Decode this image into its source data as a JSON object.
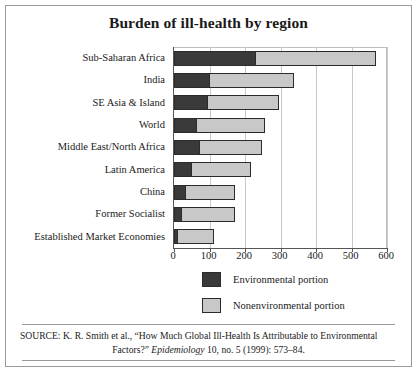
{
  "chart_data": {
    "type": "bar",
    "orientation": "horizontal",
    "stacked": true,
    "title": "Burden of ill-health by region",
    "xlabel": "",
    "ylabel": "",
    "xlim": [
      0,
      600
    ],
    "xticks": [
      0,
      100,
      200,
      300,
      400,
      500,
      600
    ],
    "xtick_labels": [
      "0",
      "100",
      "200",
      "300",
      "400",
      "500",
      "600"
    ],
    "grid": true,
    "legend_position": "bottom",
    "categories": [
      "Sub-Saharan Africa",
      "India",
      "SE Asia & Island",
      "World",
      "Middle East/North Africa",
      "Latin America",
      "China",
      "Former Socialist",
      "Established Market Economies"
    ],
    "series": [
      {
        "name": "Environmental portion",
        "color": "#3a3a3a",
        "values": [
          232,
          100,
          97,
          65,
          72,
          50,
          35,
          22,
          12
        ]
      },
      {
        "name": "Nonenvironmental portion",
        "color": "#c8c8c8",
        "values": [
          340,
          240,
          203,
          195,
          178,
          170,
          140,
          153,
          103
        ]
      }
    ],
    "totals": [
      572,
      340,
      300,
      260,
      250,
      220,
      175,
      175,
      115
    ]
  },
  "legend": {
    "items": [
      {
        "label": "Environmental portion",
        "color": "#3a3a3a"
      },
      {
        "label": "Nonenvironmental portion",
        "color": "#c8c8c8"
      }
    ]
  },
  "source": {
    "line1": "SOURCE: K. R. Smith et al., “How Much Global Ill-Health Is Attributable to Environmental",
    "line2_pre": "Factors?” ",
    "line2_italic": "Epidemiology",
    "line2_post": " 10, no. 5 (1999): 573–84."
  }
}
